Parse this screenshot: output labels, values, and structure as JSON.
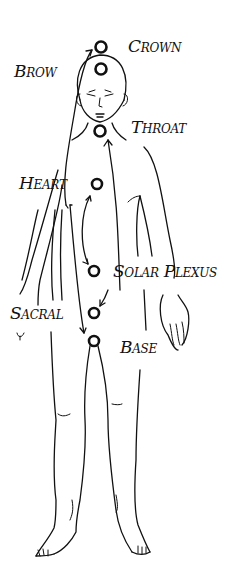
{
  "diagram": {
    "type": "chakra-body-map",
    "colors": {
      "ink": "#111111",
      "background": "#ffffff"
    },
    "chakras": [
      {
        "id": "crown",
        "label": "Crown",
        "cx": 101,
        "cy": 47,
        "r": 5.5
      },
      {
        "id": "brow",
        "label": "Brow",
        "cx": 101,
        "cy": 69,
        "r": 5.5
      },
      {
        "id": "throat",
        "label": "Throat",
        "cx": 100,
        "cy": 131,
        "r": 5.5
      },
      {
        "id": "heart",
        "label": "Heart",
        "cx": 97,
        "cy": 184,
        "r": 5
      },
      {
        "id": "solar-plexus",
        "label": "Solar Plexus",
        "cx": 94,
        "cy": 271,
        "r": 5
      },
      {
        "id": "sacral",
        "label": "Sacral",
        "cx": 94,
        "cy": 313,
        "r": 5
      },
      {
        "id": "base",
        "label": "Base",
        "cx": 94,
        "cy": 341,
        "r": 5
      }
    ],
    "labels": {
      "crown": "Crown",
      "brow": "Brow",
      "throat": "Throat",
      "heart": "Heart",
      "solar_plexus": "Solar Plexus",
      "sacral": "Sacral",
      "base": "Base"
    },
    "arrows": [
      {
        "from": "sacral",
        "to": "crown",
        "description": "long curved arrow from lower left up to crown"
      },
      {
        "from": "heart",
        "to": "solar-plexus",
        "description": "double-headed curved arrow between heart and solar plexus"
      },
      {
        "from": "solar-plexus",
        "to": "throat",
        "description": "curved arrow rising to throat"
      },
      {
        "from": "heart-area",
        "to": "base",
        "description": "arrow curving down to base"
      },
      {
        "from": "solar-plexus",
        "to": "sacral",
        "description": "short arrow to sacral"
      }
    ]
  }
}
